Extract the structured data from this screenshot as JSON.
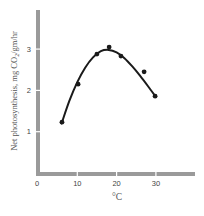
{
  "chart_data": {
    "type": "scatter",
    "title": "",
    "xlabel": "°C",
    "ylabel": "Net photosynthesis, mg CO₂/gm/hr",
    "ylabel_parts": {
      "prefix": "Net photosynthesis, mg CO",
      "subscript": "2",
      "suffix": "/gm/hr"
    },
    "xlim": [
      0,
      40
    ],
    "ylim": [
      0,
      4
    ],
    "xticks": [
      0,
      10,
      20,
      30
    ],
    "xtick_labels": [
      "0",
      "10",
      "20",
      "30"
    ],
    "yticks": [
      1,
      2,
      3
    ],
    "ytick_labels": [
      "1",
      "2",
      "3"
    ],
    "grid": false,
    "legend": null,
    "series": [
      {
        "name": "observed",
        "kind": "scatter",
        "x": [
          6.1,
          10.2,
          15.0,
          18.1,
          21.1,
          27.0,
          29.8
        ],
        "y": [
          1.23,
          2.15,
          2.88,
          3.05,
          2.83,
          2.45,
          1.86
        ]
      },
      {
        "name": "fitted curve",
        "kind": "line",
        "x": [
          6,
          8,
          10,
          12,
          14,
          16,
          18,
          20,
          22,
          24,
          26,
          28,
          30
        ],
        "y": [
          1.2,
          1.75,
          2.2,
          2.55,
          2.8,
          2.95,
          2.98,
          2.92,
          2.78,
          2.58,
          2.35,
          2.1,
          1.84
        ]
      }
    ],
    "colors": {
      "axis": "#9a9a9a",
      "axis_break": "#ffffff",
      "curve": "#1a1a1a",
      "points": "#1a1a1a",
      "text": "#444444"
    }
  }
}
